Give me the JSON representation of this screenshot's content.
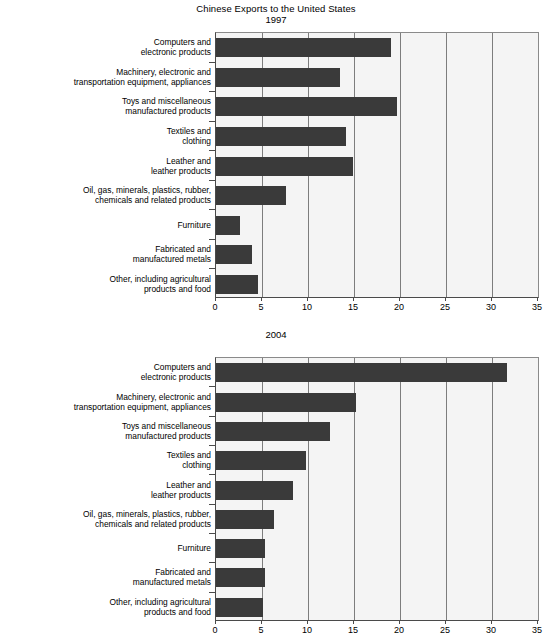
{
  "figure": {
    "title": "Chinese Exports to the United States"
  },
  "chart_data": [
    {
      "type": "bar",
      "orientation": "horizontal",
      "title": "1997",
      "xlabel": "",
      "ylabel": "",
      "xlim": [
        0,
        35
      ],
      "xticks": [
        0,
        5,
        10,
        15,
        20,
        25,
        30,
        35
      ],
      "grid": true,
      "legend": "none",
      "bar_color": "#3a3a3a",
      "plot_background": "#f4f4f4",
      "categories": [
        "Computers and\nelectronic products",
        "Machinery, electronic and\ntransportation equipment, appliances",
        "Toys and miscellaneous\nmanufactured products",
        "Textiles and\nclothing",
        "Leather and\nleather products",
        "Oil, gas, minerals, plastics, rubber,\nchemicals and related products",
        "Furniture",
        "Fabricated and\nmanufactured metals",
        "Other, including agricultural\nproducts and food"
      ],
      "values": [
        19.0,
        13.5,
        19.7,
        14.1,
        14.9,
        7.6,
        2.6,
        3.9,
        4.6
      ]
    },
    {
      "type": "bar",
      "orientation": "horizontal",
      "title": "2004",
      "xlabel": "",
      "ylabel": "",
      "xlim": [
        0,
        35
      ],
      "xticks": [
        0,
        5,
        10,
        15,
        20,
        25,
        30,
        35
      ],
      "grid": true,
      "legend": "none",
      "bar_color": "#3a3a3a",
      "plot_background": "#f4f4f4",
      "categories": [
        "Computers and\nelectronic products",
        "Machinery, electronic and\ntransportation equipment, appliances",
        "Toys and miscellaneous\nmanufactured products",
        "Textiles and\nclothing",
        "Leather and\nleather products",
        "Oil, gas, minerals, plastics, rubber,\nchemicals and related products",
        "Furniture",
        "Fabricated and\nmanufactured metals",
        "Other, including agricultural\nproducts and food"
      ],
      "values": [
        31.6,
        15.2,
        12.4,
        9.8,
        8.4,
        6.3,
        5.3,
        5.3,
        5.1
      ]
    }
  ]
}
